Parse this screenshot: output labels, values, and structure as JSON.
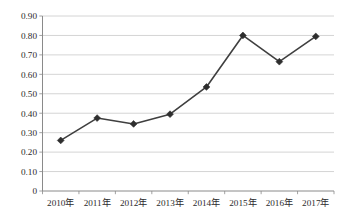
{
  "chart_data": {
    "type": "line",
    "title": "",
    "subtitle": "",
    "xlabel": "",
    "ylabel": "",
    "categories": [
      "2010年",
      "2011年",
      "2012年",
      "2013年",
      "2014年",
      "2015年",
      "2016年",
      "2017年"
    ],
    "series": [
      {
        "name": "",
        "values": [
          0.26,
          0.375,
          0.345,
          0.395,
          0.535,
          0.8,
          0.665,
          0.795
        ]
      }
    ],
    "ylim": [
      0,
      0.9
    ],
    "yticks": [
      0,
      0.1,
      0.2,
      0.3,
      0.4,
      0.5,
      0.6,
      0.7,
      0.8,
      0.9
    ],
    "ytick_labels": [
      "0",
      "0.10",
      "0.20",
      "0.30",
      "0.40",
      "0.50",
      "0.60",
      "0.70",
      "0.80",
      "0.90"
    ],
    "grid": true,
    "grid_axis": "y",
    "legend": false,
    "legend_position": "none",
    "marker": "diamond",
    "colors": {
      "line": "#3f3f3f",
      "marker": "#2e2e2e",
      "grid": "#c9c9c9",
      "axis": "#8a8a8a",
      "text": "#2b2b2b",
      "background": "#ffffff"
    }
  }
}
